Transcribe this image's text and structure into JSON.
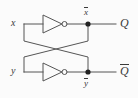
{
  "figure": {
    "name": "cross-coupled-inverter-latch",
    "background_color": "#fbfbfb",
    "wire_color": "#555555",
    "label_color": "#3a3a3a",
    "node_color": "#222222"
  },
  "inputs": [
    {
      "id": "x",
      "label": "x",
      "overbar": false
    },
    {
      "id": "y",
      "label": "y",
      "overbar": false
    }
  ],
  "nodes": [
    {
      "id": "xbar",
      "label": "x",
      "overbar": true,
      "position": "above"
    },
    {
      "id": "ybar",
      "label": "y",
      "overbar": true,
      "position": "below"
    }
  ],
  "outputs": [
    {
      "id": "Q",
      "label": "Q",
      "overbar": false
    },
    {
      "id": "Qbar",
      "label": "Q",
      "overbar": true
    }
  ],
  "gates": [
    {
      "id": "inv-top",
      "type": "inverter",
      "name": "NOT gate"
    },
    {
      "id": "inv-bottom",
      "type": "inverter",
      "name": "NOT gate"
    }
  ],
  "junctions": [
    {
      "id": "junction-top"
    },
    {
      "id": "junction-bottom"
    }
  ]
}
